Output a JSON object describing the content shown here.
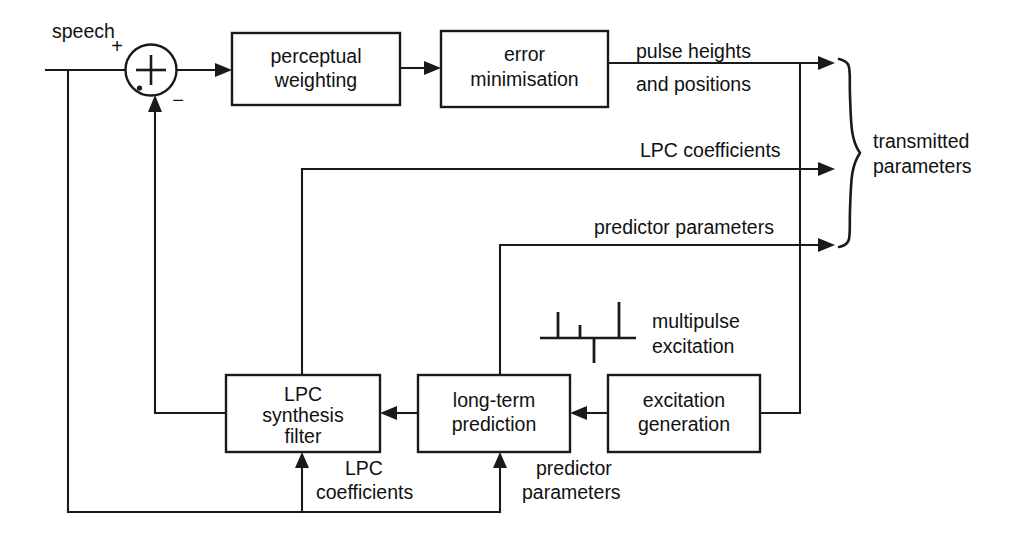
{
  "diagram": {
    "ink_color": "#1a1a1a",
    "background_color": "#ffffff"
  },
  "blocks": [
    {
      "id": "perceptual-weighting",
      "lines": [
        "perceptual",
        "weighting"
      ]
    },
    {
      "id": "error-minimisation",
      "lines": [
        "error",
        "minimisation"
      ]
    },
    {
      "id": "lpc-synthesis-filter",
      "lines": [
        "LPC",
        "synthesis",
        "filter"
      ]
    },
    {
      "id": "long-term-prediction",
      "lines": [
        "long-term",
        "prediction"
      ]
    },
    {
      "id": "excitation-generation",
      "lines": [
        "excitation",
        "generation"
      ]
    }
  ],
  "signal_labels": {
    "speech": "speech",
    "plus_sign": "+",
    "minus_sign": "−",
    "pulse_heights_line1": "pulse heights",
    "pulse_heights_line2": "and positions",
    "lpc_coefficients_top": "LPC coefficients",
    "predictor_parameters_mid": "predictor parameters",
    "multipulse_line1": "multipulse",
    "multipulse_line2": "excitation",
    "transmitted_line1": "transmitted",
    "transmitted_line2": "parameters",
    "lpc_coefficients_bottom_line1": "LPC",
    "lpc_coefficients_bottom_line2": "coefficients",
    "predictor_parameters_bottom_line1": "predictor",
    "predictor_parameters_bottom_line2": "parameters"
  },
  "summer": {
    "operator": "+",
    "input_top_sign": "+",
    "input_bottom_sign": "−"
  },
  "brace": {
    "label_line1": "transmitted",
    "label_line2": "parameters",
    "branch_count": 3
  },
  "multipulse_waveform": {
    "baseline_y": 338,
    "pulses": [
      {
        "x": 558,
        "height": 26,
        "direction": "up"
      },
      {
        "x": 580,
        "height": 13,
        "direction": "up"
      },
      {
        "x": 594,
        "height": 25,
        "direction": "down"
      },
      {
        "x": 619,
        "height": 36,
        "direction": "up"
      }
    ]
  }
}
